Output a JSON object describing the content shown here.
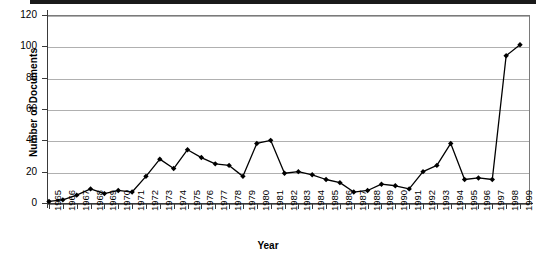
{
  "chart_data": {
    "type": "line",
    "title": "",
    "xlabel": "Year",
    "ylabel": "Number of Documents",
    "ylim": [
      0,
      120
    ],
    "y_ticks": [
      0,
      20,
      40,
      60,
      80,
      100,
      120
    ],
    "grid": true,
    "legend": "none",
    "marker": "filled-diamond",
    "line_color": "#000000",
    "marker_color": "#000000",
    "grid_color": "#b0b0b0",
    "axis_color": "#3a3a3a",
    "categories": [
      "1965",
      "1966",
      "1967",
      "1968",
      "1969",
      "1970",
      "1971",
      "1972",
      "1973",
      "1974",
      "1975",
      "1976",
      "1977",
      "1978",
      "1979",
      "1980",
      "1981",
      "1982",
      "1983",
      "1984",
      "1985",
      "1986",
      "1987",
      "1988",
      "1989",
      "1990",
      "1991",
      "1992",
      "1993",
      "1994",
      "1995",
      "1996",
      "1997",
      "1998",
      "1999"
    ],
    "values": [
      1,
      2,
      5,
      9,
      6,
      8,
      7,
      17,
      28,
      22,
      34,
      29,
      25,
      24,
      17,
      38,
      40,
      19,
      20,
      18,
      15,
      13,
      7,
      8,
      12,
      11,
      9,
      20,
      24,
      38,
      15,
      16,
      15,
      94,
      101
    ]
  }
}
